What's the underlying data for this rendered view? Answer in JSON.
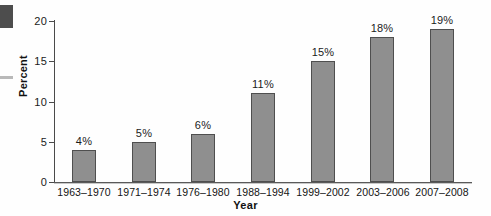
{
  "artifacts": {
    "corner_block": "scan-edge-block",
    "edge_tick": "scan-edge-tick"
  },
  "chart_data": {
    "type": "bar",
    "title": "",
    "subtitle": "",
    "xlabel": "Year",
    "ylabel": "Percent",
    "categories": [
      "1963–1970",
      "1971–1974",
      "1976–1980",
      "1988–1994",
      "1999–2002",
      "2003–2006",
      "2007–2008"
    ],
    "values": [
      4,
      5,
      6,
      11,
      15,
      18,
      19
    ],
    "data_labels": [
      "4%",
      "5%",
      "6%",
      "11%",
      "15%",
      "18%",
      "19%"
    ],
    "ylim": [
      0,
      20
    ],
    "yticks": [
      0,
      5,
      10,
      15,
      20
    ],
    "ytick_labels": [
      "0",
      "5",
      "10",
      "15",
      "20"
    ],
    "grid": false,
    "legend": null,
    "bar_color": "#8f8f8f",
    "bar_edge_color": "#4f4f4f",
    "axis_color": "#4a4a4a",
    "background_color": "#ffffff"
  }
}
